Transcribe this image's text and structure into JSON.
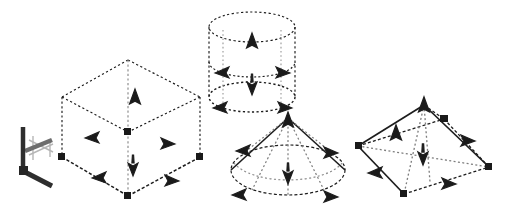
{
  "figure": {
    "background_color": "#ffffff",
    "width": 515,
    "height": 221,
    "line_color": "#1a1a1a",
    "arrow_color": "#1a1a1a",
    "stroke_style": "dashed-dotted",
    "caption": ""
  },
  "axis_triad": {
    "name": "coordinate-axis-triad",
    "origin": [
      22,
      172
    ],
    "colors": {
      "z_axis": "#3a3a3a",
      "x_axis": "#555555",
      "y_axis": "#a8a8a8"
    },
    "arms": [
      {
        "label": "z",
        "from": [
          22,
          172
        ],
        "to": [
          22,
          126
        ],
        "color": "#3a3a3a",
        "width": 4
      },
      {
        "label": "x",
        "from": [
          22,
          172
        ],
        "to": [
          52,
          186
        ],
        "color": "#4a4a4a",
        "width": 5
      },
      {
        "label": "y",
        "from": [
          22,
          150
        ],
        "to": [
          50,
          136
        ],
        "color": "#4f4f4f",
        "width": 4
      },
      {
        "label": "y2",
        "from": [
          30,
          140
        ],
        "to": [
          52,
          150
        ],
        "color": "#b0b0b0",
        "width": 2
      },
      {
        "label": "y3",
        "from": [
          30,
          155
        ],
        "to": [
          52,
          145
        ],
        "color": "#b0b0b0",
        "width": 2
      }
    ]
  },
  "shapes": [
    {
      "id": "box",
      "name": "wireframe-box",
      "label": "Hexahedron / Box",
      "vertices": {
        "top_back": [
          128,
          60
        ],
        "top_left": [
          62,
          97
        ],
        "top_right": [
          200,
          97
        ],
        "top_front": [
          128,
          132
        ],
        "bot_left": [
          62,
          157
        ],
        "bot_right": [
          200,
          157
        ],
        "bot_front": [
          128,
          196
        ]
      },
      "normals": [
        {
          "dir": "up",
          "at": [
            135,
            98
          ],
          "kind": "triangle-up"
        },
        {
          "dir": "down",
          "at": [
            133,
            167
          ],
          "kind": "arrow-down"
        },
        {
          "dir": "left",
          "at": [
            94,
            137
          ],
          "kind": "arrow-left"
        },
        {
          "dir": "right",
          "at": [
            166,
            143
          ],
          "kind": "arrow-right"
        },
        {
          "dir": "edge",
          "at": [
            101,
            177
          ],
          "kind": "arrow-left-low"
        },
        {
          "dir": "edge",
          "at": [
            170,
            180
          ],
          "kind": "arrow-right-low"
        }
      ]
    },
    {
      "id": "cylinder",
      "name": "wireframe-cylinder",
      "label": "Cylinder",
      "geometry": {
        "center_top": [
          252,
          27
        ],
        "center_bottom": [
          252,
          97
        ],
        "radius_x": 43,
        "radius_y": 15,
        "height": 70
      },
      "normals": [
        {
          "dir": "up",
          "at": [
            252,
            42
          ],
          "kind": "triangle-up"
        },
        {
          "dir": "down",
          "at": [
            252,
            87
          ],
          "kind": "arrow-down"
        },
        {
          "dir": "left",
          "at": [
            222,
            72
          ],
          "kind": "arrow-left"
        },
        {
          "dir": "right",
          "at": [
            282,
            72
          ],
          "kind": "arrow-right"
        },
        {
          "dir": "left",
          "at": [
            222,
            108
          ],
          "kind": "arrow-left-low"
        },
        {
          "dir": "right",
          "at": [
            282,
            108
          ],
          "kind": "arrow-right-low"
        }
      ]
    },
    {
      "id": "cone",
      "name": "wireframe-cone",
      "label": "Cone",
      "geometry": {
        "apex": [
          288,
          118
        ],
        "base_center": [
          288,
          168
        ],
        "radius_x": 57,
        "radius_y": 24
      },
      "normals": [
        {
          "dir": "up",
          "at": [
            288,
            122
          ],
          "kind": "triangle-up"
        },
        {
          "dir": "down",
          "at": [
            288,
            178
          ],
          "kind": "arrow-down"
        },
        {
          "dir": "left",
          "at": [
            243,
            150
          ],
          "kind": "arrow-left"
        },
        {
          "dir": "right",
          "at": [
            327,
            152
          ],
          "kind": "arrow-right"
        },
        {
          "dir": "left",
          "at": [
            241,
            196
          ],
          "kind": "arrow-left-low"
        },
        {
          "dir": "right",
          "at": [
            327,
            198
          ],
          "kind": "arrow-right-low"
        }
      ]
    },
    {
      "id": "pyramid",
      "name": "wireframe-pyramid",
      "label": "Pyramid",
      "vertices": {
        "apex": [
          424,
          105
        ],
        "base_left": [
          358,
          146
        ],
        "base_front": [
          404,
          194
        ],
        "base_right": [
          490,
          167
        ],
        "base_back": [
          444,
          119
        ]
      },
      "normals": [
        {
          "dir": "up",
          "at": [
            397,
            134
          ],
          "kind": "triangle-up"
        },
        {
          "dir": "down",
          "at": [
            423,
            158
          ],
          "kind": "arrow-down"
        },
        {
          "dir": "left",
          "at": [
            379,
            173
          ],
          "kind": "arrow-left-low"
        },
        {
          "dir": "right",
          "at": [
            466,
            141
          ],
          "kind": "arrow-right"
        },
        {
          "dir": "edge",
          "at": [
            447,
            184
          ],
          "kind": "arrow-right-low"
        },
        {
          "dir": "edge",
          "at": [
            441,
            121
          ],
          "kind": "arrow-node"
        }
      ]
    }
  ]
}
